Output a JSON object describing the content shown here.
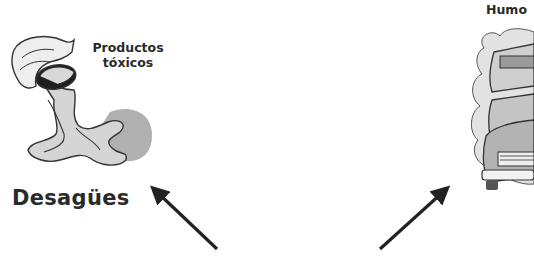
{
  "left_panel": {
    "caption_line1": "Productos",
    "caption_line2": "tóxicos",
    "title": "Desagües",
    "illustration": "drain-pipe-pouring-liquid"
  },
  "right_panel": {
    "caption": "Humo",
    "illustration": "cars-exhaust-smoke"
  },
  "arrows": [
    {
      "direction": "up-left",
      "from": [
        217,
        249
      ],
      "to": [
        152,
        187
      ]
    },
    {
      "direction": "up-right",
      "from": [
        380,
        249
      ],
      "to": [
        448,
        187
      ]
    }
  ],
  "colors": {
    "ink": "#222222",
    "fill_light": "#e6e6e6",
    "fill_mid": "#b8b8b8",
    "fill_dark": "#8c8c8c"
  }
}
